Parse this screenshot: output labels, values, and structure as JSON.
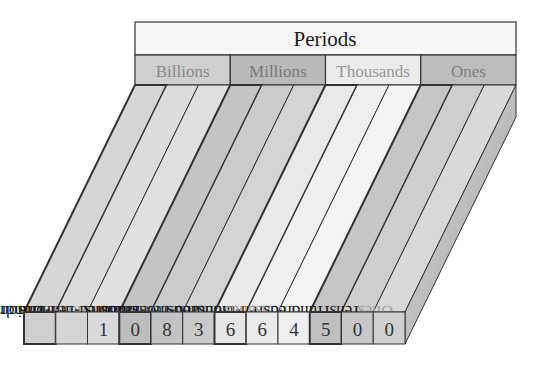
{
  "header": {
    "title": "Periods",
    "periods": [
      {
        "label": "Billions",
        "fill": "#cfcfcf",
        "text_color": "#8a8a8a"
      },
      {
        "label": "Millions",
        "fill": "#b9b9b9",
        "text_color": "#7a7a7a"
      },
      {
        "label": "Thousands",
        "fill": "#ececec",
        "text_color": "#9a9a9a"
      },
      {
        "label": "Ones",
        "fill": "#bdbdbd",
        "text_color": "#808080"
      }
    ]
  },
  "places": [
    {
      "label": "Hundred-billions",
      "digit": "",
      "period": 0,
      "muted": false
    },
    {
      "label": "Ten-billions",
      "digit": "",
      "period": 0,
      "muted": false
    },
    {
      "label": "Billions",
      "digit": "1",
      "period": 0,
      "muted": true
    },
    {
      "label": "Hundred-millions",
      "digit": "0",
      "period": 1,
      "muted": false
    },
    {
      "label": "Ten-millions",
      "digit": "8",
      "period": 1,
      "muted": false
    },
    {
      "label": "Millions",
      "digit": "3",
      "period": 1,
      "muted": true
    },
    {
      "label": "Hundred-thousands",
      "digit": "6",
      "period": 2,
      "muted": false
    },
    {
      "label": "Ten-thousands",
      "digit": "6",
      "period": 2,
      "muted": false
    },
    {
      "label": "Thousands",
      "digit": "4",
      "period": 2,
      "muted": true
    },
    {
      "label": "Hundreds",
      "digit": "5",
      "period": 3,
      "muted": false
    },
    {
      "label": "Tens",
      "digit": "0",
      "period": 3,
      "muted": false
    },
    {
      "label": "Ones",
      "digit": "0",
      "period": 3,
      "muted": true
    }
  ],
  "number": "1,083,664,500",
  "colors": {
    "line": "#333333",
    "label_text": "#1a1a1a",
    "muted_text": "#a0a0a0",
    "digit_text": "#333333",
    "side_panel": "#a9a9a9",
    "title_fill": "#f6f6f6"
  }
}
